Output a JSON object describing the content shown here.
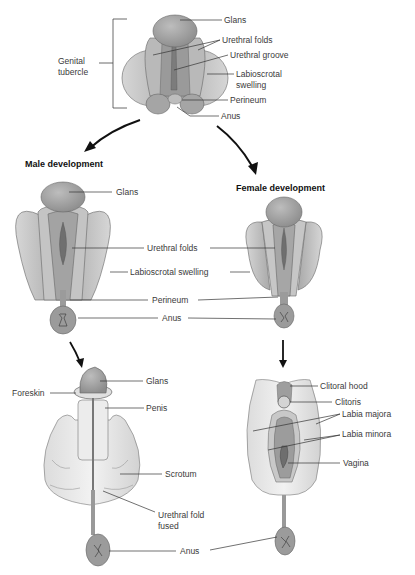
{
  "indifferent_stage": {
    "group_label": "Genital tubercle",
    "labels": {
      "glans": "Glans",
      "urethral_folds": "Urethral folds",
      "urethral_groove": "Urethral groove",
      "labioscrotal_swelling": "Labioscrotal swelling",
      "perineum": "Perineum",
      "anus": "Anus"
    }
  },
  "male": {
    "heading": "Male development",
    "stage1": {
      "glans": "Glans",
      "urethral_folds": "Urethral folds",
      "labioscrotal_swelling": "Labioscrotal swelling",
      "perineum": "Perineum",
      "anus": "Anus"
    },
    "stage2": {
      "foreskin": "Foreskin",
      "glans": "Glans",
      "penis": "Penis",
      "scrotum": "Scrotum",
      "urethral_fold_fused": "Urethral fold fused",
      "anus": "Anus"
    }
  },
  "female": {
    "heading": "Female development",
    "stage2": {
      "clitoral_hood": "Clitoral hood",
      "clitoris": "Clitoris",
      "labia_majora": "Labia majora",
      "labia_minora": "Labia minora",
      "vagina": "Vagina"
    }
  },
  "colors": {
    "tissue_light": "#c9c9c9",
    "tissue_mid": "#a8a8a8",
    "tissue_dark": "#7f7f7f",
    "skin_pale": "#e6e6e6",
    "leader_line": "#333333"
  }
}
